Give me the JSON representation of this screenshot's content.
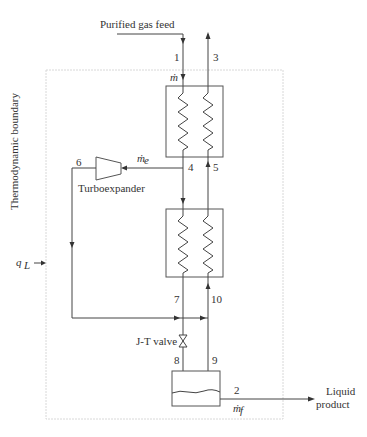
{
  "diagram": {
    "type": "process-flow",
    "boundary_label": "Thermodynamic boundary",
    "heat_leak_label": "q",
    "heat_leak_sub": "L",
    "feed_label": "Purified gas feed",
    "product_label_line1": "Liquid",
    "product_label_line2": "product",
    "turboexpander_label": "Turboexpander",
    "jt_valve_label": "J-T valve",
    "mass_flow": {
      "m": "ṁ",
      "me": "ṁ",
      "me_sub": "e",
      "mf": "ṁ",
      "mf_sub": "f"
    },
    "state_points": [
      "1",
      "2",
      "3",
      "4",
      "5",
      "6",
      "7",
      "8",
      "9",
      "10"
    ],
    "components": [
      {
        "id": "hx1",
        "name": "Heat exchanger 1"
      },
      {
        "id": "hx2",
        "name": "Heat exchanger 2"
      },
      {
        "id": "expander",
        "name": "Turboexpander"
      },
      {
        "id": "jt",
        "name": "J-T valve"
      },
      {
        "id": "separator",
        "name": "Liquid receiver / separator"
      }
    ]
  }
}
